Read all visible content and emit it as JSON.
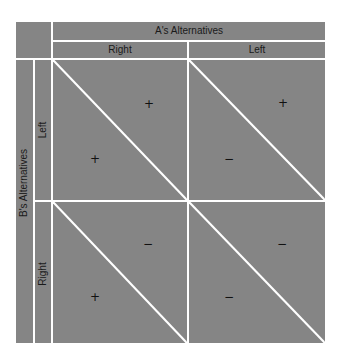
{
  "matrix": {
    "column_player_label": "A's Alternatives",
    "row_player_label": "B's Alternatives",
    "columns": [
      "Right",
      "Left"
    ],
    "rows": [
      "Left",
      "Right"
    ],
    "cells": [
      {
        "row": "Left",
        "col": "Right",
        "upper_right": "+",
        "lower_left": "+"
      },
      {
        "row": "Left",
        "col": "Left",
        "upper_right": "+",
        "lower_left": "−"
      },
      {
        "row": "Right",
        "col": "Right",
        "upper_right": "−",
        "lower_left": "+"
      },
      {
        "row": "Right",
        "col": "Left",
        "upper_right": "−",
        "lower_left": "−"
      }
    ]
  },
  "colors": {
    "fill": "#858585",
    "lines": "#ffffff",
    "text": "#1a1a1a"
  }
}
